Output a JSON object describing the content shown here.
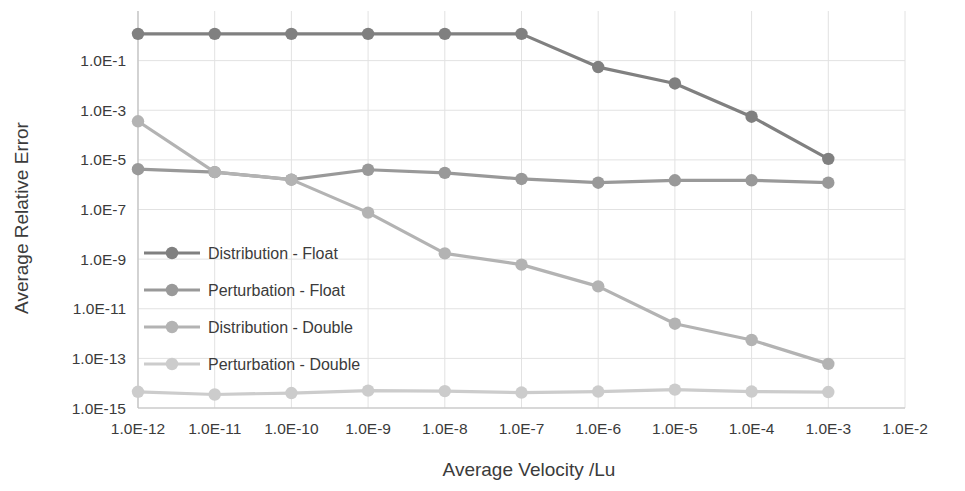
{
  "chart_data": {
    "type": "line",
    "title": "",
    "xlabel": "Average Velocity /Lu",
    "ylabel": "Average Relative Error",
    "xscale": "log",
    "yscale": "log",
    "xlim": [
      1e-12,
      0.01
    ],
    "ylim": [
      1e-15,
      10.0
    ],
    "grid": true,
    "legend_position": "inside-left-middle",
    "xticklabels": [
      "1.0E-12",
      "1.0E-11",
      "1.0E-10",
      "1.0E-9",
      "1.0E-8",
      "1.0E-7",
      "1.0E-6",
      "1.0E-5",
      "1.0E-4",
      "1.0E-3",
      "1.0E-2"
    ],
    "xtickvalues": [
      1e-12,
      1e-11,
      1e-10,
      1e-09,
      1e-08,
      1e-07,
      1e-06,
      1e-05,
      0.0001,
      0.001,
      0.01
    ],
    "yticklabels": [
      "1.0E-1",
      "1.0E-3",
      "1.0E-5",
      "1.0E-7",
      "1.0E-9",
      "1.0E-11",
      "1.0E-13",
      "1.0E-15"
    ],
    "ytickvalues": [
      0.1,
      0.001,
      1e-05,
      1e-07,
      1e-09,
      1e-11,
      1e-13,
      1e-15
    ],
    "x": [
      1e-12,
      1e-11,
      1e-10,
      1e-09,
      1e-08,
      1e-07,
      1e-06,
      1e-05,
      0.0001,
      0.001
    ],
    "series": [
      {
        "name": "Distribution - Float",
        "color": "#808080",
        "values": [
          1.2,
          1.2,
          1.2,
          1.2,
          1.2,
          1.2,
          0.055,
          0.012,
          0.00055,
          1.1e-05
        ]
      },
      {
        "name": "Perturbation - Float",
        "color": "#999999",
        "values": [
          4.2e-06,
          3.2e-06,
          1.6e-06,
          4e-06,
          3e-06,
          1.7e-06,
          1.2e-06,
          1.5e-06,
          1.5e-06,
          1.2e-06
        ]
      },
      {
        "name": "Distribution - Double",
        "color": "#b3b3b3",
        "values": [
          0.00036,
          3.2e-06,
          1.6e-06,
          7.5e-08,
          1.7e-09,
          6e-10,
          8e-11,
          2.5e-12,
          5.5e-13,
          6e-14
        ]
      },
      {
        "name": "Perturbation - Double",
        "color": "#cccccc",
        "values": [
          4.5e-15,
          3.5e-15,
          4e-15,
          5e-15,
          4.8e-15,
          4.2e-15,
          4.6e-15,
          5.5e-15,
          4.6e-15,
          4.4e-15
        ]
      }
    ]
  },
  "axes": {
    "xlabel": "Average Velocity /Lu",
    "ylabel": "Average Relative Error"
  },
  "legend": {
    "items": [
      {
        "label": "Distribution - Float"
      },
      {
        "label": "Perturbation - Float"
      },
      {
        "label": "Distribution - Double"
      },
      {
        "label": "Perturbation - Double"
      }
    ]
  },
  "colors": {
    "series_1": "#808080",
    "series_2": "#999999",
    "series_3": "#b3b3b3",
    "series_4": "#cccccc",
    "gridline": "#e2e2e2",
    "axis": "#bfbfbf",
    "text": "#3b3b3b",
    "background": "#ffffff"
  }
}
